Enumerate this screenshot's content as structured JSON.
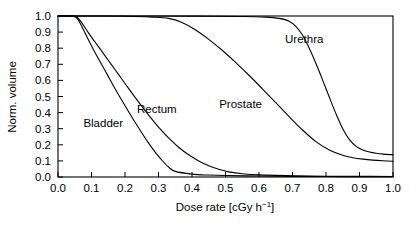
{
  "chart_data": {
    "type": "line",
    "title": "",
    "xlabel": "Dose rate [cGy h⁻¹]",
    "xlabel_base": "Dose rate [cGy h",
    "xlabel_sup": "−1",
    "xlabel_tail": "]",
    "ylabel": "Norm. volume",
    "xlim": [
      0.0,
      1.0
    ],
    "ylim": [
      0.0,
      1.0
    ],
    "grid": false,
    "legend_position": "inline-annotations",
    "xticks": [
      "0.0",
      "0.1",
      "0.2",
      "0.3",
      "0.4",
      "0.5",
      "0.6",
      "0.7",
      "0.8",
      "0.9",
      "1.0"
    ],
    "xtick_values": [
      0.0,
      0.1,
      0.2,
      0.3,
      0.4,
      0.5,
      0.6,
      0.7,
      0.8,
      0.9,
      1.0
    ],
    "yticks": [
      "0.0",
      "0.1",
      "0.2",
      "0.3",
      "0.4",
      "0.5",
      "0.6",
      "0.7",
      "0.8",
      "0.9",
      "1.0"
    ],
    "ytick_values": [
      0.0,
      0.1,
      0.2,
      0.3,
      0.4,
      0.5,
      0.6,
      0.7,
      0.8,
      0.9,
      1.0
    ],
    "series": [
      {
        "name": "Bladder",
        "label": "Bladder",
        "color": "#000000",
        "label_x": 0.135,
        "label_y": 0.335,
        "x": [
          0.0,
          0.04,
          0.055,
          0.07,
          0.09,
          0.11,
          0.13,
          0.15,
          0.17,
          0.19,
          0.21,
          0.23,
          0.25,
          0.27,
          0.29,
          0.31,
          0.33,
          0.35,
          0.4,
          0.45,
          0.5,
          0.6,
          0.7,
          0.8,
          0.9,
          1.0
        ],
        "y": [
          1.0,
          1.0,
          0.99,
          0.94,
          0.855,
          0.775,
          0.7,
          0.625,
          0.55,
          0.478,
          0.408,
          0.34,
          0.275,
          0.212,
          0.155,
          0.105,
          0.062,
          0.035,
          0.018,
          0.012,
          0.009,
          0.006,
          0.004,
          0.003,
          0.002,
          0.002
        ]
      },
      {
        "name": "Rectum",
        "label": "Rectum",
        "color": "#000000",
        "label_x": 0.295,
        "label_y": 0.425,
        "x": [
          0.0,
          0.04,
          0.055,
          0.07,
          0.09,
          0.11,
          0.13,
          0.15,
          0.17,
          0.19,
          0.21,
          0.23,
          0.25,
          0.27,
          0.29,
          0.31,
          0.33,
          0.36,
          0.39,
          0.42,
          0.45,
          0.48,
          0.51,
          0.55,
          0.6,
          0.7,
          0.8,
          0.9,
          1.0
        ],
        "y": [
          1.0,
          1.0,
          0.995,
          0.96,
          0.898,
          0.84,
          0.783,
          0.725,
          0.668,
          0.61,
          0.552,
          0.495,
          0.44,
          0.386,
          0.335,
          0.287,
          0.243,
          0.185,
          0.138,
          0.1,
          0.07,
          0.048,
          0.032,
          0.02,
          0.013,
          0.008,
          0.005,
          0.004,
          0.003
        ]
      },
      {
        "name": "Prostate",
        "label": "Prostate",
        "color": "#000000",
        "label_x": 0.545,
        "label_y": 0.455,
        "x": [
          0.0,
          0.1,
          0.2,
          0.28,
          0.33,
          0.37,
          0.41,
          0.45,
          0.49,
          0.53,
          0.57,
          0.61,
          0.65,
          0.69,
          0.73,
          0.77,
          0.81,
          0.85,
          0.88,
          0.91,
          0.94,
          0.97,
          1.0
        ],
        "y": [
          1.0,
          1.0,
          0.998,
          0.993,
          0.985,
          0.96,
          0.915,
          0.855,
          0.787,
          0.712,
          0.632,
          0.548,
          0.462,
          0.375,
          0.292,
          0.22,
          0.168,
          0.135,
          0.12,
          0.111,
          0.105,
          0.101,
          0.098
        ]
      },
      {
        "name": "Urethra",
        "label": "Urethra",
        "color": "#000000",
        "label_x": 0.735,
        "label_y": 0.855,
        "x": [
          0.0,
          0.2,
          0.4,
          0.55,
          0.62,
          0.66,
          0.69,
          0.71,
          0.73,
          0.75,
          0.77,
          0.79,
          0.81,
          0.83,
          0.85,
          0.87,
          0.89,
          0.91,
          0.93,
          0.95,
          0.97,
          1.0
        ],
        "y": [
          1.0,
          1.0,
          0.999,
          0.997,
          0.993,
          0.985,
          0.968,
          0.935,
          0.88,
          0.8,
          0.705,
          0.602,
          0.495,
          0.392,
          0.3,
          0.232,
          0.19,
          0.168,
          0.155,
          0.147,
          0.142,
          0.138
        ]
      }
    ]
  },
  "figure": {
    "background_color": "#ffffff",
    "line_color": "#000000"
  }
}
